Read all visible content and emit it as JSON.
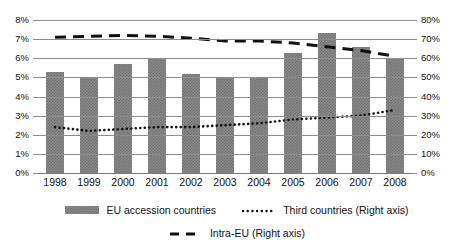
{
  "chart_data": {
    "type": "bar",
    "title": "",
    "subtitle": "",
    "xlabel": "",
    "ylabel": "",
    "y2label": "",
    "categories": [
      "1998",
      "1999",
      "2000",
      "2001",
      "2002",
      "2003",
      "2004",
      "2005",
      "2006",
      "2007",
      "2008"
    ],
    "ylim": [
      0,
      8
    ],
    "y2lim": [
      0,
      80
    ],
    "grid": true,
    "legend_position": "bottom",
    "yticks": [
      "0%",
      "1%",
      "2%",
      "3%",
      "4%",
      "5%",
      "6%",
      "7%",
      "8%"
    ],
    "ytick_values": [
      0,
      1,
      2,
      3,
      4,
      5,
      6,
      7,
      8
    ],
    "y2ticks": [
      "0%",
      "10%",
      "20%",
      "30%",
      "40%",
      "50%",
      "60%",
      "70%",
      "80%"
    ],
    "y2tick_values": [
      0,
      10,
      20,
      30,
      40,
      50,
      60,
      70,
      80
    ],
    "series": [
      {
        "name": "EU accession countries",
        "render": "bar",
        "axis": "left",
        "color": "#8a8a8a",
        "values": [
          5.3,
          5.0,
          5.7,
          6.0,
          5.2,
          5.0,
          5.0,
          6.3,
          7.3,
          6.6,
          6.0
        ]
      },
      {
        "name": "Third countries (Right axis)",
        "render": "dotted-line",
        "axis": "right",
        "color": "#111111",
        "values": [
          24,
          22,
          23,
          24,
          24,
          25,
          26,
          28,
          29,
          30,
          33
        ]
      },
      {
        "name": "Intra-EU (Right axis)",
        "render": "dashed-line",
        "axis": "right",
        "color": "#111111",
        "values": [
          71,
          71.5,
          72,
          71.5,
          70.5,
          69,
          69,
          68,
          66,
          64,
          61
        ]
      }
    ]
  },
  "legend": {
    "items": [
      {
        "label": "EU accession countries",
        "marker": "bar-swatch"
      },
      {
        "label": "Third countries (Right axis)",
        "marker": "dotted-line-swatch"
      },
      {
        "label": "Intra-EU (Right axis)",
        "marker": "dashed-line-swatch"
      }
    ]
  }
}
